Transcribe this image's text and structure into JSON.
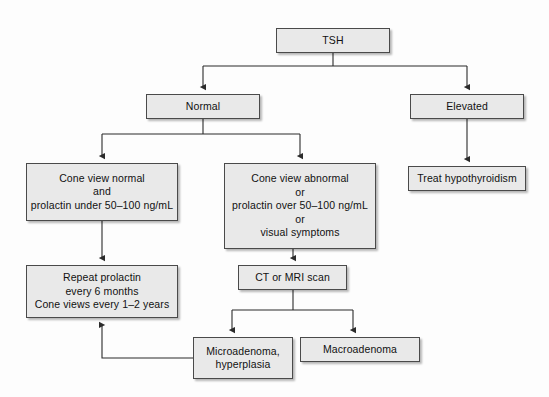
{
  "diagram": {
    "background_color": "#fdfdfd",
    "node_fill_color": "#e9e9e9",
    "node_border_color": "#4a4a4a",
    "connector_color": "#2b2b2b",
    "nodes": [
      {
        "id": "tsh",
        "label": "TSH",
        "x": 276,
        "y": 28,
        "w": 114,
        "h": 25
      },
      {
        "id": "normal",
        "label": "Normal",
        "x": 146,
        "y": 94,
        "w": 114,
        "h": 25
      },
      {
        "id": "elevated",
        "label": "Elevated",
        "x": 410,
        "y": 94,
        "w": 114,
        "h": 25
      },
      {
        "id": "cone-normal",
        "label": "Cone view normal\nand\nprolactin under 50–100 ng/mL",
        "x": 26,
        "y": 163,
        "w": 152,
        "h": 58
      },
      {
        "id": "cone-abnormal",
        "label": "Cone view abnormal\nor\nprolactin over 50–100 ng/mL\nor\nvisual symptoms",
        "x": 224,
        "y": 163,
        "w": 152,
        "h": 86
      },
      {
        "id": "treat-hypo",
        "label": "Treat hypothyroidism",
        "x": 408,
        "y": 166,
        "w": 118,
        "h": 25
      },
      {
        "id": "repeat",
        "label": "Repeat prolactin\nevery 6 months\nCone views every 1–2 years",
        "x": 26,
        "y": 265,
        "w": 152,
        "h": 53
      },
      {
        "id": "ct-mri",
        "label": "CT or MRI scan",
        "x": 238,
        "y": 265,
        "w": 109,
        "h": 25
      },
      {
        "id": "microadenoma",
        "label": "Microadenoma,\nhyperplasia",
        "x": 193,
        "y": 337,
        "w": 100,
        "h": 42
      },
      {
        "id": "macroadenoma",
        "label": "Macroadenoma",
        "x": 300,
        "y": 337,
        "w": 120,
        "h": 25
      }
    ],
    "connectors": [
      {
        "id": "tsh-to-split",
        "from": "tsh",
        "to": "split-bar-1"
      },
      {
        "id": "split-to-normal",
        "from": "split-bar-1",
        "to": "normal"
      },
      {
        "id": "split-to-elevated",
        "from": "split-bar-1",
        "to": "elevated"
      },
      {
        "id": "normal-to-split",
        "from": "normal",
        "to": "split-bar-2"
      },
      {
        "id": "split-to-cone-normal",
        "from": "split-bar-2",
        "to": "cone-normal"
      },
      {
        "id": "split-to-cone-abn",
        "from": "split-bar-2",
        "to": "cone-abnormal"
      },
      {
        "id": "elevated-to-treat",
        "from": "elevated",
        "to": "treat-hypo"
      },
      {
        "id": "cone-normal-to-repeat",
        "from": "cone-normal",
        "to": "repeat"
      },
      {
        "id": "cone-abn-to-ct",
        "from": "cone-abnormal",
        "to": "ct-mri"
      },
      {
        "id": "ct-to-micro",
        "from": "ct-mri",
        "to": "microadenoma"
      },
      {
        "id": "ct-to-macro",
        "from": "ct-mri",
        "to": "macroadenoma"
      },
      {
        "id": "micro-feedback",
        "from": "microadenoma",
        "to": "repeat"
      }
    ]
  }
}
